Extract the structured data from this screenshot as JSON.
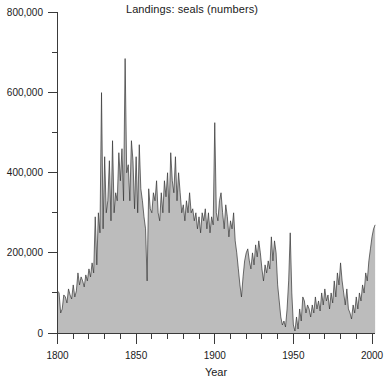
{
  "chart_data": {
    "type": "area",
    "title": "Landings: seals (numbers)",
    "xlabel": "Year",
    "ylabel": "",
    "xlim": [
      1800,
      2005
    ],
    "ylim": [
      0,
      800000
    ],
    "grid": false,
    "legend": "none",
    "x_major_ticks": [
      1800,
      1850,
      1900,
      1950,
      2000
    ],
    "x_major_tick_labels": [
      "1800",
      "1850",
      "1900",
      "1950",
      "2000"
    ],
    "x_minor_tick_step": 10,
    "y_major_ticks": [
      0,
      200000,
      400000,
      600000,
      800000
    ],
    "y_major_tick_labels": [
      "0",
      "200,000",
      "400,000",
      "600,000",
      "800,000"
    ],
    "y_minor_ticks": [
      100000,
      300000,
      500000,
      700000
    ],
    "series": [
      {
        "name": "Landings: seals (numbers)",
        "fill_color": "#bcbcbc",
        "line_color": "#333333",
        "x": [
          1800,
          1801,
          1802,
          1803,
          1804,
          1805,
          1806,
          1807,
          1808,
          1809,
          1810,
          1811,
          1812,
          1813,
          1814,
          1815,
          1816,
          1817,
          1818,
          1819,
          1820,
          1821,
          1822,
          1823,
          1824,
          1825,
          1826,
          1827,
          1828,
          1829,
          1830,
          1831,
          1832,
          1833,
          1834,
          1835,
          1836,
          1837,
          1838,
          1839,
          1840,
          1841,
          1842,
          1843,
          1844,
          1845,
          1846,
          1847,
          1848,
          1849,
          1850,
          1851,
          1852,
          1853,
          1854,
          1855,
          1856,
          1857,
          1858,
          1859,
          1860,
          1861,
          1862,
          1863,
          1864,
          1865,
          1866,
          1867,
          1868,
          1869,
          1870,
          1871,
          1872,
          1873,
          1874,
          1875,
          1876,
          1877,
          1878,
          1879,
          1880,
          1881,
          1882,
          1883,
          1884,
          1885,
          1886,
          1887,
          1888,
          1889,
          1890,
          1891,
          1892,
          1893,
          1894,
          1895,
          1896,
          1897,
          1898,
          1899,
          1900,
          1901,
          1902,
          1903,
          1904,
          1905,
          1906,
          1907,
          1908,
          1909,
          1910,
          1911,
          1912,
          1913,
          1914,
          1915,
          1916,
          1917,
          1918,
          1919,
          1920,
          1921,
          1922,
          1923,
          1924,
          1925,
          1926,
          1927,
          1928,
          1929,
          1930,
          1931,
          1932,
          1933,
          1934,
          1935,
          1936,
          1937,
          1938,
          1939,
          1940,
          1941,
          1942,
          1943,
          1944,
          1945,
          1946,
          1947,
          1948,
          1949,
          1950,
          1951,
          1952,
          1953,
          1954,
          1955,
          1956,
          1957,
          1958,
          1959,
          1960,
          1961,
          1962,
          1963,
          1964,
          1965,
          1966,
          1967,
          1968,
          1969,
          1970,
          1971,
          1972,
          1973,
          1974,
          1975,
          1976,
          1977,
          1978,
          1979,
          1980,
          1981,
          1982,
          1983,
          1984,
          1985,
          1986,
          1987,
          1988,
          1989,
          1990,
          1991,
          1992,
          1993,
          1994,
          1995,
          1996,
          1997,
          1998,
          1999,
          2000,
          2001,
          2002
        ],
        "values": [
          105000,
          100000,
          50000,
          60000,
          95000,
          90000,
          75000,
          110000,
          95000,
          85000,
          120000,
          90000,
          105000,
          150000,
          120000,
          140000,
          130000,
          115000,
          145000,
          130000,
          160000,
          140000,
          175000,
          150000,
          290000,
          170000,
          300000,
          250000,
          600000,
          260000,
          440000,
          300000,
          330000,
          430000,
          280000,
          480000,
          300000,
          350000,
          330000,
          450000,
          380000,
          460000,
          330000,
          685000,
          400000,
          420000,
          330000,
          480000,
          430000,
          310000,
          440000,
          300000,
          470000,
          360000,
          330000,
          290000,
          260000,
          130000,
          360000,
          310000,
          300000,
          350000,
          330000,
          380000,
          300000,
          280000,
          350000,
          300000,
          380000,
          340000,
          400000,
          300000,
          450000,
          380000,
          350000,
          440000,
          330000,
          400000,
          350000,
          300000,
          320000,
          280000,
          330000,
          300000,
          350000,
          300000,
          310000,
          280000,
          300000,
          260000,
          290000,
          250000,
          300000,
          280000,
          310000,
          260000,
          300000,
          250000,
          290000,
          270000,
          525000,
          300000,
          280000,
          330000,
          350000,
          300000,
          260000,
          320000,
          290000,
          240000,
          280000,
          260000,
          300000,
          230000,
          200000,
          160000,
          120000,
          90000,
          140000,
          180000,
          200000,
          210000,
          180000,
          160000,
          200000,
          170000,
          220000,
          190000,
          230000,
          200000,
          160000,
          130000,
          170000,
          150000,
          180000,
          160000,
          240000,
          180000,
          230000,
          200000,
          120000,
          80000,
          40000,
          20000,
          30000,
          15000,
          60000,
          130000,
          250000,
          100000,
          20000,
          5000,
          40000,
          10000,
          60000,
          30000,
          90000,
          80000,
          50000,
          70000,
          60000,
          40000,
          70000,
          50000,
          90000,
          60000,
          80000,
          55000,
          100000,
          70000,
          110000,
          80000,
          95000,
          60000,
          100000,
          75000,
          130000,
          90000,
          150000,
          120000,
          175000,
          130000,
          100000,
          70000,
          110000,
          60000,
          50000,
          35000,
          70000,
          50000,
          90000,
          60000,
          100000,
          80000,
          120000,
          100000,
          150000,
          130000,
          180000,
          210000,
          240000,
          260000,
          270000
        ]
      }
    ]
  },
  "axes": {
    "y_label_0": "0",
    "y_label_200k": "200,000",
    "y_label_400k": "400,000",
    "y_label_600k": "600,000",
    "y_label_800k": "800,000",
    "x_label_1800": "1800",
    "x_label_1850": "1850",
    "x_label_1900": "1900",
    "x_label_1950": "1950",
    "x_label_2000": "2000",
    "x_axis_title": "Year"
  }
}
